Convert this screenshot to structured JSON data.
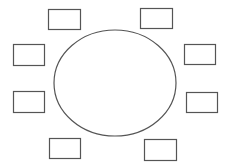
{
  "diagram": {
    "type": "table-seating-layout",
    "canvas": {
      "width": 228,
      "height": 167,
      "background": "#ffffff"
    },
    "stroke_color": "#555555",
    "table": {
      "shape": "ellipse",
      "cx": 115,
      "cy": 83,
      "rx": 61,
      "ry": 53
    },
    "seats": [
      {
        "id": "seat-top-left",
        "x": 48,
        "y": 9,
        "w": 32,
        "h": 20
      },
      {
        "id": "seat-top-right",
        "x": 140,
        "y": 8,
        "w": 32,
        "h": 20
      },
      {
        "id": "seat-left-upper",
        "x": 13,
        "y": 44,
        "w": 31,
        "h": 21
      },
      {
        "id": "seat-right-upper",
        "x": 184,
        "y": 44,
        "w": 31,
        "h": 20
      },
      {
        "id": "seat-left-lower",
        "x": 13,
        "y": 91,
        "w": 31,
        "h": 21
      },
      {
        "id": "seat-right-lower",
        "x": 186,
        "y": 92,
        "w": 31,
        "h": 20
      },
      {
        "id": "seat-bottom-left",
        "x": 49,
        "y": 138,
        "w": 31,
        "h": 20
      },
      {
        "id": "seat-bottom-right",
        "x": 144,
        "y": 139,
        "w": 32,
        "h": 21
      }
    ]
  }
}
